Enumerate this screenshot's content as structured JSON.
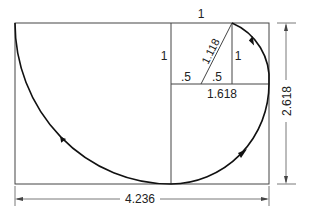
{
  "diagram": {
    "labels": {
      "top_square_side": "1",
      "left_square_side": "1",
      "diagonal": "1.118",
      "right_small_side": "1",
      "half_left": ".5",
      "half_right": ".5",
      "golden_width": "1.618",
      "height_dimension": "2.618",
      "width_dimension": "4.236"
    },
    "colors": {
      "line": "#333333",
      "spiral": "#111111",
      "text": "#222222"
    }
  }
}
